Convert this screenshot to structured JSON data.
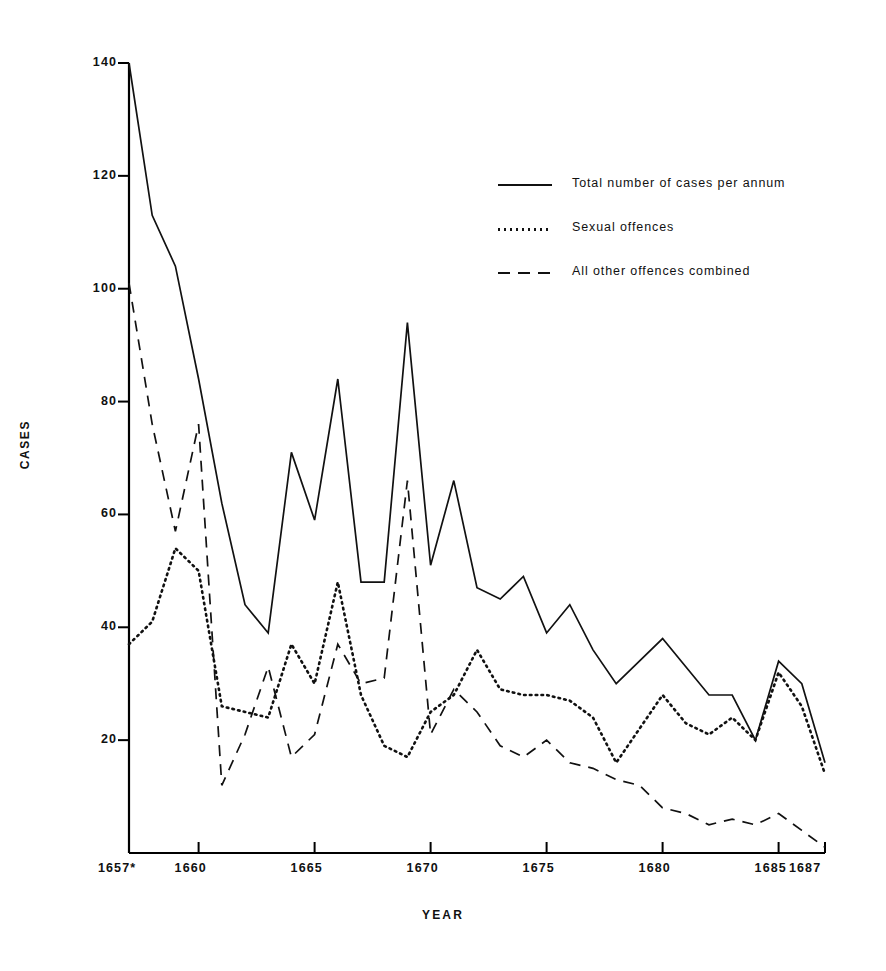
{
  "chart_data": {
    "type": "line",
    "title": "",
    "xlabel": "YEAR",
    "ylabel": "CASES",
    "xlim": [
      1657,
      1687
    ],
    "ylim": [
      0,
      140
    ],
    "grid": false,
    "legend_position": "upper-right-inside",
    "x_tick_labels": [
      "1657*",
      "1660",
      "1665",
      "1670",
      "1675",
      "1680",
      "1685",
      "1687"
    ],
    "x_tick_values": [
      1657,
      1660,
      1665,
      1670,
      1675,
      1680,
      1685,
      1687
    ],
    "y_tick_labels": [
      "20",
      "40",
      "60",
      "80",
      "100",
      "120",
      "140"
    ],
    "y_tick_values": [
      20,
      40,
      60,
      80,
      100,
      120,
      140
    ],
    "x": [
      1657,
      1658,
      1659,
      1660,
      1661,
      1662,
      1663,
      1664,
      1665,
      1666,
      1667,
      1668,
      1669,
      1670,
      1671,
      1672,
      1673,
      1674,
      1675,
      1676,
      1677,
      1678,
      1679,
      1680,
      1681,
      1682,
      1683,
      1684,
      1685,
      1686,
      1687
    ],
    "series": [
      {
        "name": "Total number of cases per annum",
        "style": "solid",
        "values": [
          140,
          113,
          104,
          84,
          62,
          44,
          39,
          71,
          59,
          84,
          48,
          48,
          94,
          51,
          66,
          47,
          45,
          49,
          39,
          44,
          36,
          30,
          34,
          38,
          33,
          28,
          28,
          20,
          34,
          30,
          16
        ]
      },
      {
        "name": "Sexual offences",
        "style": "dotted",
        "values": [
          37,
          41,
          54,
          50,
          26,
          25,
          24,
          37,
          30,
          48,
          28,
          19,
          17,
          25,
          28,
          36,
          29,
          28,
          28,
          27,
          24,
          16,
          22,
          28,
          23,
          21,
          24,
          20,
          32,
          26,
          14
        ]
      },
      {
        "name": "All other offences combined",
        "style": "dashed",
        "values": [
          101,
          76,
          57,
          76,
          12,
          21,
          33,
          17,
          21,
          37,
          30,
          31,
          66,
          21,
          29,
          25,
          19,
          17,
          20,
          16,
          15,
          13,
          12,
          8,
          7,
          5,
          6,
          5,
          7,
          4,
          1
        ]
      }
    ]
  },
  "legend": {
    "items": [
      {
        "label": "Total number of cases per annum",
        "style": "solid"
      },
      {
        "label": "Sexual offences",
        "style": "dotted"
      },
      {
        "label": "All other offences combined",
        "style": "dashed"
      }
    ]
  },
  "axes": {
    "y_title": "CASES",
    "x_title": "YEAR"
  },
  "colors": {
    "line": "#111111",
    "axis": "#000000",
    "background": "#ffffff"
  }
}
